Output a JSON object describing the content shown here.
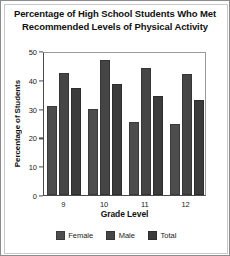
{
  "chart_data": {
    "type": "bar",
    "title": "Percentage of High School Students Who Met Recommended Levels of Physical Activity",
    "title_line1": "Percentage of High School Students Who Met",
    "title_line2": "Recommended Levels of Physical Activity",
    "xlabel": "Grade Level",
    "ylabel": "Percentage of Students",
    "categories": [
      "9",
      "10",
      "11",
      "12"
    ],
    "series": [
      {
        "name": "Female",
        "values": [
          31,
          30,
          25.5,
          24.5
        ],
        "color": "#4d4d4d"
      },
      {
        "name": "Male",
        "values": [
          42.5,
          47,
          44,
          42
        ],
        "color": "#454545"
      },
      {
        "name": "Total",
        "values": [
          37,
          38.5,
          34.5,
          33
        ],
        "color": "#3b3b3b"
      }
    ],
    "ylim": [
      0,
      50
    ],
    "yticks": [
      0,
      10,
      20,
      30,
      40,
      50
    ],
    "ytick_labels": [
      "0",
      "10",
      "20",
      "30",
      "40",
      "50"
    ],
    "grid": false,
    "legend_position": "bottom"
  }
}
